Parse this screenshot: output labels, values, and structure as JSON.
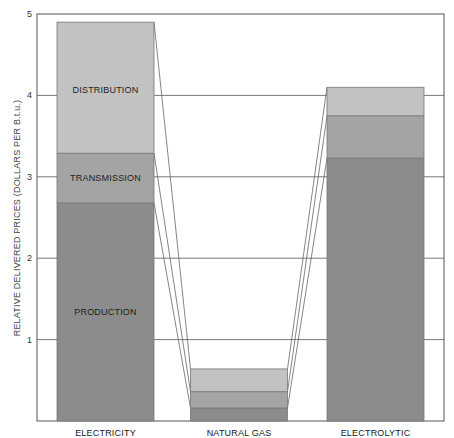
{
  "chart_data": {
    "type": "bar",
    "stacked": true,
    "title": "",
    "xlabel": "",
    "ylabel": "RELATIVE DELIVERED PRICES (DOLLARS PER B.t.u.)",
    "ylim": [
      0,
      5
    ],
    "yticks": [
      1,
      2,
      3,
      4,
      5
    ],
    "ytick_labels": [
      "1",
      "2",
      "3",
      "4",
      "5"
    ],
    "grid": true,
    "legend": "none (segment labels inside first bar)",
    "categories": [
      "ELECTRICITY",
      "NATURAL GAS",
      "ELECTROLYTIC"
    ],
    "series": [
      {
        "name": "PRODUCTION",
        "values": [
          2.68,
          0.16,
          3.23
        ],
        "color": "#8c8c8c"
      },
      {
        "name": "TRANSMISSION",
        "values": [
          0.61,
          0.2,
          0.52
        ],
        "color": "#a4a4a4"
      },
      {
        "name": "DISTRIBUTION",
        "values": [
          1.61,
          0.28,
          0.35
        ],
        "color": "#c2c2c2"
      }
    ],
    "segment_labels": [
      "PRODUCTION",
      "TRANSMISSION",
      "DISTRIBUTION"
    ],
    "connector_lines": true
  }
}
